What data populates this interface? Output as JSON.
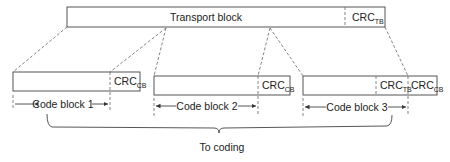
{
  "diagram": {
    "transport_block": {
      "label": "Transport block",
      "crc_label": "CRC",
      "crc_sub": "TB"
    },
    "code_blocks": [
      {
        "label": "Code block 1",
        "crc_label": "CRC",
        "crc_sub": "CB"
      },
      {
        "label": "Code block 2",
        "crc_label": "CRC",
        "crc_sub": "CB"
      },
      {
        "label": "Code block 3",
        "crc_label": "CRC",
        "crc_sub": "CB",
        "extra_crc_label": "CRC",
        "extra_crc_sub": "TB"
      }
    ],
    "output_label": "To coding",
    "colors": {
      "line": "#555555",
      "text": "#222222",
      "background": "#ffffff"
    }
  }
}
